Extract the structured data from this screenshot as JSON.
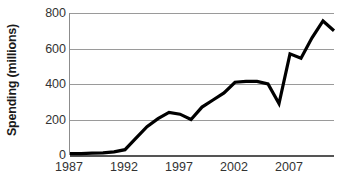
{
  "chart_data": {
    "type": "line",
    "title": "",
    "xlabel": "",
    "ylabel": "Spending (millions)",
    "xlim": [
      1987,
      2011
    ],
    "ylim": [
      0,
      800
    ],
    "ytick_labels": [
      "800",
      "600",
      "400",
      "200",
      "0"
    ],
    "ytick_values": [
      800,
      600,
      400,
      200,
      0
    ],
    "xtick_labels": [
      "1987",
      "1992",
      "1997",
      "2002",
      "2007"
    ],
    "xtick_values": [
      1987,
      1992,
      1997,
      2002,
      2007
    ],
    "grid": "horizontal",
    "legend": "none",
    "line_color": "#000000",
    "grid_color": "#9a9a9a",
    "series": [
      {
        "name": "Spending",
        "x": [
          1987,
          1988,
          1989,
          1990,
          1991,
          1992,
          1993,
          1994,
          1995,
          1996,
          1997,
          1998,
          1999,
          2000,
          2001,
          2002,
          2003,
          2004,
          2005,
          2006,
          2007,
          2008,
          2009,
          2010,
          2011
        ],
        "values": [
          8,
          8,
          10,
          12,
          18,
          30,
          95,
          160,
          205,
          240,
          230,
          200,
          270,
          310,
          350,
          410,
          415,
          415,
          400,
          290,
          570,
          545,
          660,
          755,
          700
        ]
      }
    ]
  }
}
